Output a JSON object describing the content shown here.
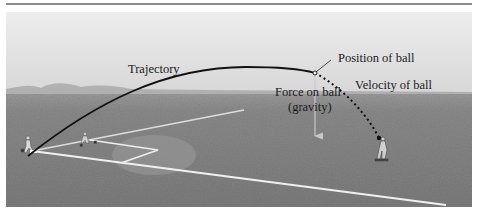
{
  "figure": {
    "labels": {
      "trajectory": "Trajectory",
      "position": "Position of ball",
      "velocity": "Velocity of ball",
      "force_line1": "Force on ball",
      "force_line2": "(gravity)"
    },
    "colors": {
      "sky_top": "#ececec",
      "sky_horizon": "#d6d6d6",
      "field": "#838383",
      "trajectory": "#111111",
      "foul_lines": "#f2f2f2",
      "gravity_arrow": "#c9c9c9",
      "top_rule": "#8c8c8c"
    }
  }
}
